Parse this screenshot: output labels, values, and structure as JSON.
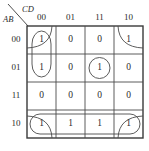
{
  "diagram": {
    "type": "karnaugh-map",
    "title": "",
    "variables": "ABCD",
    "column_axis_label": "CD",
    "row_axis_label": "AB",
    "column_headers": [
      "00",
      "01",
      "11",
      "10"
    ],
    "row_headers": [
      "00",
      "01",
      "11",
      "10"
    ],
    "cells": [
      {
        "row": "00",
        "values": [
          "1",
          "0",
          "0",
          "1"
        ]
      },
      {
        "row": "01",
        "values": [
          "1",
          "0",
          "1",
          "0"
        ]
      },
      {
        "row": "11",
        "values": [
          "0",
          "0",
          "0",
          "0"
        ]
      },
      {
        "row": "10",
        "values": [
          "1",
          "1",
          "1",
          "1"
        ]
      }
    ],
    "groups": [
      {
        "name": "group-column-00-rows-00-01",
        "shape": "vertical-oval",
        "cells": [
          "00/00",
          "01/00"
        ]
      },
      {
        "name": "group-corners-wrap",
        "shape": "corner-arcs",
        "cells": [
          "00/00",
          "00/10",
          "10/00",
          "10/10"
        ]
      },
      {
        "name": "group-single-01-11",
        "shape": "circle",
        "cells": [
          "01/11"
        ]
      },
      {
        "name": "group-row-10-all",
        "shape": "horizontal-oval",
        "cells": [
          "10/00",
          "10/01",
          "10/11",
          "10/10"
        ]
      }
    ],
    "colors": {
      "grid": "#3a3a3a",
      "text": "#2b2b2b",
      "loop": "#4b4b4b",
      "background": "#ffffff"
    }
  }
}
